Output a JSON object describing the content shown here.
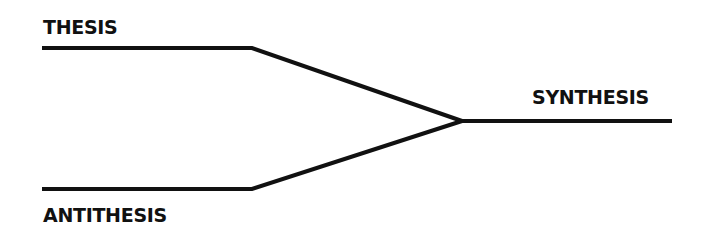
{
  "diagram": {
    "type": "convergence",
    "line_color": "#111111",
    "nodes": [
      {
        "id": "thesis",
        "label": "THESIS"
      },
      {
        "id": "antithesis",
        "label": "ANTITHESIS"
      },
      {
        "id": "synthesis",
        "label": "SYNTHESIS"
      }
    ],
    "edges": [
      {
        "from": "thesis",
        "to": "synthesis"
      },
      {
        "from": "antithesis",
        "to": "synthesis"
      }
    ]
  }
}
